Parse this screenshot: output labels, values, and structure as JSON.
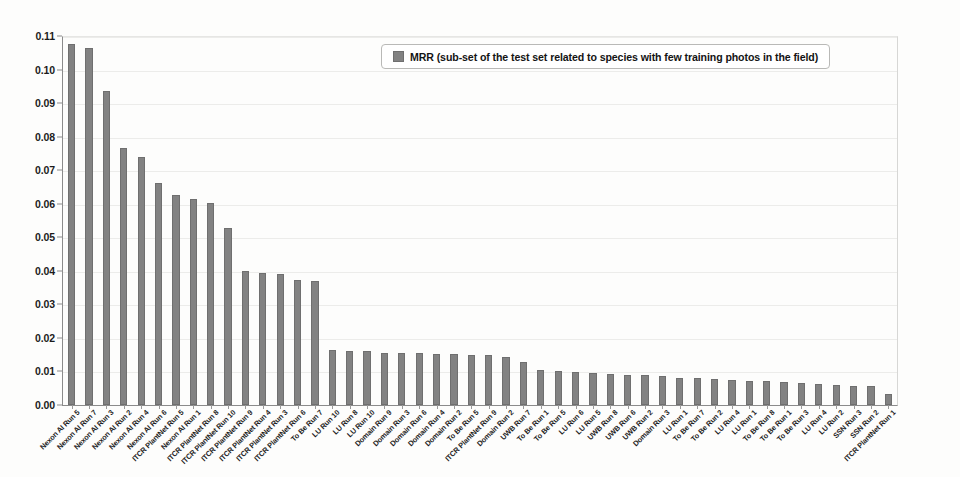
{
  "chart_data": {
    "type": "bar",
    "title": "",
    "subtitle": "",
    "xlabel": "",
    "ylabel": "",
    "ylim": [
      0.0,
      0.11
    ],
    "grid": true,
    "legend_position": "top-center",
    "legend": [
      "MRR (sub-set of the test set related to species with few training photos in the field)"
    ],
    "y_ticks": [
      "0.00",
      "0.01",
      "0.02",
      "0.03",
      "0.04",
      "0.05",
      "0.06",
      "0.07",
      "0.08",
      "0.09",
      "0.10",
      "0.11"
    ],
    "y_tick_values": [
      0.0,
      0.01,
      0.02,
      0.03,
      0.04,
      0.05,
      0.06,
      0.07,
      0.08,
      0.09,
      0.1,
      0.11
    ],
    "series_name": "MRR",
    "bar_color": "#828282",
    "categories": [
      "Nexon AI Run 5",
      "Nexon AI Run 7",
      "Nexon AI Run 3",
      "Nexon AI Run 2",
      "Nexon AI Run 4",
      "Nexon AI Run 6",
      "ITCR PlantNet Run 5",
      "Nexon AI Run 1",
      "ITCR PlantNet Run 8",
      "ITCR PlantNet Run 10",
      "ITCR PlantNet Run 9",
      "ITCR PlantNet Run 4",
      "ITCR PlantNet Run 3",
      "ITCR PlantNet Run 6",
      "To Be Run 7",
      "LU Run 10",
      "LU Run 8",
      "LU Run 10",
      "Domain Run 9",
      "Domain Run 3",
      "Domain Run 6",
      "Domain Run 4",
      "Domain Run 2",
      "To Be Run 5",
      "ITCR PlantNet Run 9",
      "Domain Run 2",
      "UWB Run 7",
      "To Be Run 1",
      "To Be Run 5",
      "LU Run 6",
      "LU Run 5",
      "UWB Run 8",
      "UWB Run 6",
      "UWB Run 2",
      "Domain Run 3",
      "LU Run 1",
      "To Be Run 7",
      "To Be Run 2",
      "LU Run 4",
      "LU Run 1",
      "To Be Run 8",
      "To Be Run 1",
      "To Be Run 3",
      "LU Run 4",
      "LU Run 2",
      "SSN Run 3",
      "SSN Run 2",
      "ITCR PlantNet Run 1"
    ],
    "values": [
      0.1077,
      0.1065,
      0.0937,
      0.0765,
      0.0738,
      0.0661,
      0.0626,
      0.0615,
      0.0601,
      0.0527,
      0.0399,
      0.0394,
      0.0391,
      0.0372,
      0.037,
      0.0163,
      0.0162,
      0.016,
      0.0156,
      0.0155,
      0.0154,
      0.0152,
      0.0151,
      0.015,
      0.0149,
      0.0143,
      0.0128,
      0.0103,
      0.01,
      0.0098,
      0.0095,
      0.0093,
      0.009,
      0.0088,
      0.0086,
      0.0082,
      0.008,
      0.0077,
      0.0076,
      0.0073,
      0.0071,
      0.0069,
      0.0067,
      0.0062,
      0.006,
      0.0058,
      0.0056,
      0.0033
    ]
  }
}
